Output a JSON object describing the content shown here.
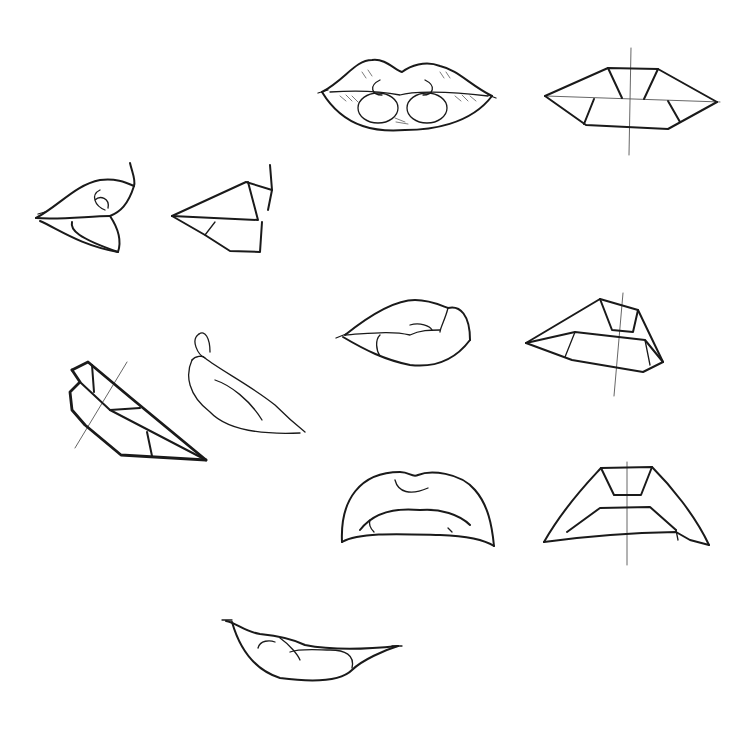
{
  "image": {
    "subject": "pencil sketch study sheet of lips",
    "background": "#ffffff",
    "ink_color": "#1a1a1a",
    "drawings": [
      {
        "id": "front-lips-rendered",
        "view": "front",
        "style": "shaded"
      },
      {
        "id": "front-lips-planes",
        "view": "front",
        "style": "geometric planes with center guidelines"
      },
      {
        "id": "side-lips-rendered",
        "view": "profile",
        "style": "shaded"
      },
      {
        "id": "side-lips-planes",
        "view": "profile",
        "style": "geometric planes"
      },
      {
        "id": "three-quarter-lips-rendered",
        "view": "three-quarter",
        "style": "line"
      },
      {
        "id": "three-quarter-lips-planes",
        "view": "three-quarter",
        "style": "geometric planes with guideline"
      },
      {
        "id": "tilted-profile-planes",
        "view": "tilted profile",
        "style": "geometric planes with guideline"
      },
      {
        "id": "tilted-profile-rendered",
        "view": "tilted profile",
        "style": "line"
      },
      {
        "id": "low-angle-lips-rendered",
        "view": "from below",
        "style": "line"
      },
      {
        "id": "low-angle-lips-planes",
        "view": "from below",
        "style": "geometric planes with center guideline"
      },
      {
        "id": "smile-lips-rendered",
        "view": "front smile",
        "style": "line"
      }
    ]
  }
}
